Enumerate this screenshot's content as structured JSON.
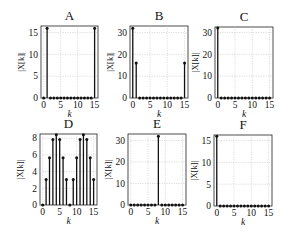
{
  "figure": {
    "width": 282,
    "height": 235,
    "background": "#ffffff",
    "stem_color": "#111111",
    "grid_color": "#bbbbbb"
  },
  "chart_data": [
    {
      "type": "stem",
      "title": "A",
      "xlabel": "k",
      "ylabel": "|X[k]|",
      "x": [
        0,
        1,
        2,
        3,
        4,
        5,
        6,
        7,
        8,
        9,
        10,
        11,
        12,
        13,
        14,
        15
      ],
      "values": [
        0,
        16,
        0,
        0,
        0,
        0,
        0,
        0,
        0,
        0,
        0,
        0,
        0,
        0,
        0,
        16
      ],
      "xticks": [
        0,
        5,
        10,
        15
      ],
      "yticks": [
        0,
        5,
        10,
        15
      ],
      "xlim": [
        -0.8,
        16
      ],
      "ylim": [
        0,
        16.5
      ],
      "grid": true,
      "frame": {
        "left": 41,
        "top": 26,
        "right": 98,
        "bottom": 98
      }
    },
    {
      "type": "stem",
      "title": "B",
      "xlabel": "k",
      "ylabel": "|X[k]|",
      "x": [
        0,
        1,
        2,
        3,
        4,
        5,
        6,
        7,
        8,
        9,
        10,
        11,
        12,
        13,
        14,
        15
      ],
      "values": [
        32,
        16,
        0,
        0,
        0,
        0,
        0,
        0,
        0,
        0,
        0,
        0,
        0,
        0,
        0,
        16
      ],
      "xticks": [
        0,
        5,
        10,
        15
      ],
      "yticks": [
        0,
        10,
        20,
        30
      ],
      "xlim": [
        -0.8,
        16
      ],
      "ylim": [
        0,
        33
      ],
      "grid": true,
      "frame": {
        "left": 130,
        "top": 26,
        "right": 188,
        "bottom": 98
      }
    },
    {
      "type": "stem",
      "title": "C",
      "xlabel": "k",
      "ylabel": "|X[k]|",
      "x": [
        0,
        1,
        2,
        3,
        4,
        5,
        6,
        7,
        8,
        9,
        10,
        11,
        12,
        13,
        14,
        15
      ],
      "values": [
        32,
        0,
        0,
        0,
        0,
        0,
        0,
        0,
        0,
        0,
        0,
        0,
        0,
        0,
        0,
        0
      ],
      "xticks": [
        0,
        5,
        10,
        15
      ],
      "yticks": [
        0,
        10,
        20,
        30
      ],
      "xlim": [
        -0.8,
        16
      ],
      "ylim": [
        0,
        32.5
      ],
      "grid": true,
      "frame": {
        "left": 215,
        "top": 27,
        "right": 273,
        "bottom": 98
      }
    },
    {
      "type": "stem",
      "title": "D",
      "xlabel": "k",
      "ylabel": "|X[k]|",
      "x": [
        0,
        1,
        2,
        3,
        4,
        5,
        6,
        7,
        8,
        9,
        10,
        11,
        12,
        13,
        14,
        15
      ],
      "values": [
        0,
        3.06,
        5.66,
        7.85,
        8.4,
        7.85,
        5.66,
        3.06,
        0,
        3.06,
        5.66,
        7.85,
        8.4,
        7.85,
        5.66,
        3.06
      ],
      "xticks": [
        0,
        5,
        10,
        15
      ],
      "yticks": [
        0,
        2,
        4,
        6,
        8
      ],
      "xlim": [
        -0.8,
        16
      ],
      "ylim": [
        0,
        8.5
      ],
      "grid": true,
      "frame": {
        "left": 40,
        "top": 134,
        "right": 97,
        "bottom": 205
      }
    },
    {
      "type": "stem",
      "title": "E",
      "xlabel": "k",
      "ylabel": "|X[k]|",
      "x": [
        0,
        1,
        2,
        3,
        4,
        5,
        6,
        7,
        8,
        9,
        10,
        11,
        12,
        13,
        14,
        15
      ],
      "values": [
        0,
        0,
        0,
        0,
        0,
        0,
        0,
        0,
        32,
        0,
        0,
        0,
        0,
        0,
        0,
        0
      ],
      "xticks": [
        0,
        5,
        10,
        15
      ],
      "yticks": [
        0,
        10,
        20,
        30
      ],
      "xlim": [
        -0.8,
        16
      ],
      "ylim": [
        0,
        33
      ],
      "grid": true,
      "frame": {
        "left": 128,
        "top": 134,
        "right": 186,
        "bottom": 205
      }
    },
    {
      "type": "stem",
      "title": "F",
      "xlabel": "k",
      "ylabel": "|X[k]|",
      "x": [
        0,
        1,
        2,
        3,
        4,
        5,
        6,
        7,
        8,
        9,
        10,
        11,
        12,
        13,
        14,
        15
      ],
      "values": [
        16,
        0,
        0,
        0,
        0,
        0,
        0,
        0,
        0,
        0,
        0,
        0,
        0,
        0,
        0,
        0
      ],
      "xticks": [
        0,
        5,
        10,
        15
      ],
      "yticks": [
        0,
        5,
        10,
        15
      ],
      "xlim": [
        -0.8,
        16
      ],
      "ylim": [
        0,
        16.3
      ],
      "grid": true,
      "frame": {
        "left": 214,
        "top": 135,
        "right": 272,
        "bottom": 206
      }
    }
  ]
}
